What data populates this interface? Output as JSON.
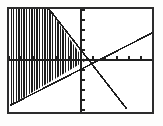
{
  "figure": {
    "kind": "graphing-calculator-plot",
    "title": "",
    "background_color": "#fdfdfc",
    "frame": {
      "stroke_color": "#2b2b2b",
      "stroke_width": 1.6,
      "fill_color": "#ffffff",
      "x": 8,
      "y": 8,
      "width": 145,
      "height": 105
    }
  },
  "chart_data": {
    "type": "line",
    "title": "",
    "xlabel": "",
    "ylabel": "",
    "grid": false,
    "legend": "none",
    "axes": {
      "origin_px": {
        "x": 81,
        "y": 60
      },
      "x_axis": {
        "label": "",
        "color": "#1f1f1f",
        "from_px": {
          "x": 9,
          "y": 60
        },
        "to_px": {
          "x": 152,
          "y": 60
        },
        "tick_spacing_px": 12,
        "tick_length_px": 4,
        "tick_labels": []
      },
      "y_axis": {
        "label": "",
        "color": "#1f1f1f",
        "from_px": {
          "x": 81,
          "y": 9
        },
        "to_px": {
          "x": 81,
          "y": 112
        },
        "tick_spacing_px": 10,
        "tick_length_px": 4,
        "tick_labels": []
      }
    },
    "series": [
      {
        "name": "ascending-line",
        "description": "line with positive slope through the origin",
        "color": "#1f1f1f",
        "stroke_width": 1.6,
        "points_px": [
          {
            "x": 11,
            "y": 105
          },
          {
            "x": 152,
            "y": 33
          }
        ]
      },
      {
        "name": "descending-line",
        "description": "line with negative slope through the origin",
        "color": "#1f1f1f",
        "stroke_width": 1.6,
        "points_px": [
          {
            "x": 49,
            "y": 9
          },
          {
            "x": 126,
            "y": 108
          }
        ]
      }
    ],
    "shaded_region": {
      "name": "hatched-wedge",
      "description": "vertical line hatching filling the wedge between the two lines left of the y-axis",
      "hatch_style": "vertical-lines",
      "hatch_color": "#1c1c1c",
      "hatch_spacing_px": 2.6,
      "hatch_stroke_width": 1.4,
      "polygon_px": [
        {
          "x": 11,
          "y": 105
        },
        {
          "x": 85,
          "y": 61
        },
        {
          "x": 49,
          "y": 9
        },
        {
          "x": 11,
          "y": 9
        }
      ]
    }
  }
}
